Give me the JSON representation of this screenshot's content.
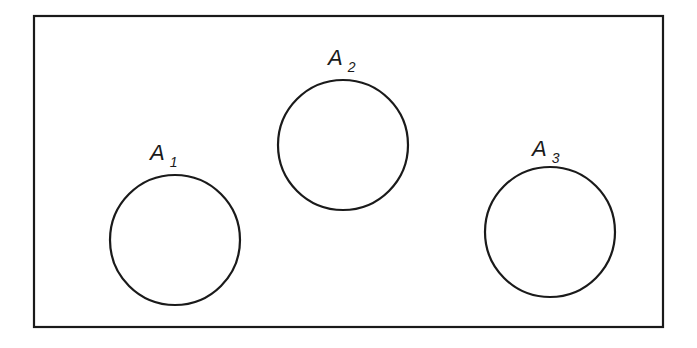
{
  "diagram": {
    "type": "venn-disjoint-sets",
    "universe": {
      "x": 34,
      "y": 16,
      "width": 629,
      "height": 311
    },
    "sets": [
      {
        "label": "A",
        "subscript": "1",
        "cx": 175,
        "cy": 240,
        "r": 65,
        "label_x": 150,
        "label_y": 160
      },
      {
        "label": "A",
        "subscript": "2",
        "cx": 343,
        "cy": 145,
        "r": 65,
        "label_x": 328,
        "label_y": 65
      },
      {
        "label": "A",
        "subscript": "3",
        "cx": 550,
        "cy": 232,
        "r": 65,
        "label_x": 532,
        "label_y": 156
      }
    ],
    "stroke_color": "#1a1a1a"
  }
}
